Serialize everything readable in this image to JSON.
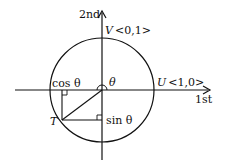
{
  "diagram": {
    "type": "unit-circle",
    "axes": {
      "horizontal_label": "1st",
      "vertical_label": "2nd"
    },
    "points": {
      "U": {
        "name": "U",
        "coords": "<1,0>"
      },
      "V": {
        "name": "V",
        "coords": "<0,1>"
      },
      "T": {
        "name": "T"
      }
    },
    "labels": {
      "theta": "θ",
      "cos": "cos θ",
      "sin": "sin θ"
    },
    "colors": {
      "stroke": "#111111",
      "background": "#ffffff"
    }
  }
}
